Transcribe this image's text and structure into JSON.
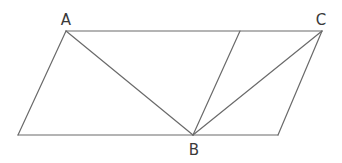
{
  "diagram": {
    "type": "geometry",
    "stroke_color": "#6a6a6a",
    "label_color": "#3a3a3a",
    "points": {
      "A": {
        "label": "A",
        "x": 66,
        "y": 31
      },
      "C": {
        "label": "C",
        "x": 322,
        "y": 31
      },
      "B": {
        "label": "B",
        "x": 193,
        "y": 135
      },
      "D": {
        "x": 240,
        "y": 31
      },
      "bottom_left": {
        "x": 18,
        "y": 135
      },
      "bottom_right": {
        "x": 278,
        "y": 135
      }
    },
    "labels": {
      "A": "A",
      "B": "B",
      "C": "C"
    },
    "segments": [
      {
        "from": "A",
        "to": "C",
        "name": "top-edge"
      },
      {
        "from": "bottom_left",
        "to": "bottom_right",
        "name": "bottom-edge"
      },
      {
        "from": "A",
        "to": "bottom_left",
        "name": "left-edge"
      },
      {
        "from": "C",
        "to": "bottom_right",
        "name": "right-edge"
      },
      {
        "from": "A",
        "to": "B",
        "name": "segment-AB"
      },
      {
        "from": "D",
        "to": "B",
        "name": "segment-DB"
      },
      {
        "from": "C",
        "to": "B",
        "name": "segment-CB"
      }
    ]
  }
}
